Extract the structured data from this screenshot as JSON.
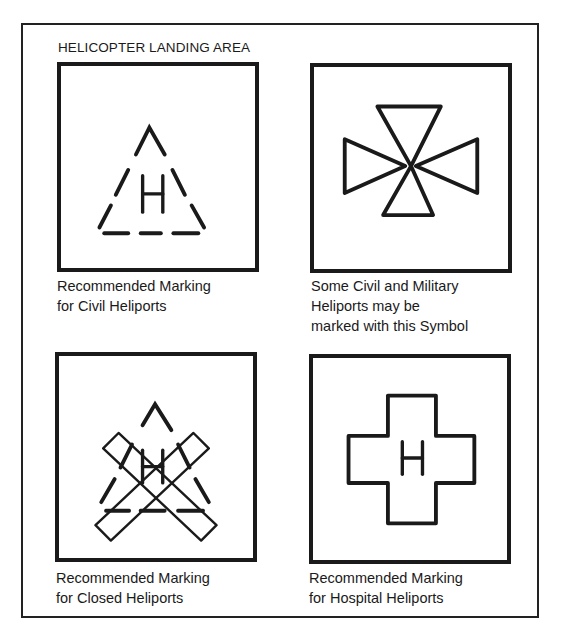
{
  "title": "HELICOPTER LANDING AREA",
  "panels": [
    {
      "symbol": "dashed-triangle-with-H",
      "caption_lines": [
        "Recommended Marking",
        "for Civil Heliports"
      ]
    },
    {
      "symbol": "maltese-cross",
      "caption_lines": [
        "Some Civil and Military",
        "Heliports may be",
        "marked with this Symbol"
      ]
    },
    {
      "symbol": "dashed-triangle-with-H-crossed-out",
      "caption_lines": [
        "Recommended Marking",
        "for Closed Heliports"
      ]
    },
    {
      "symbol": "cross-with-H",
      "caption_lines": [
        "Recommended Marking",
        "for Hospital Heliports"
      ]
    }
  ],
  "glyphs": {
    "h": "H"
  },
  "colors": {
    "ink": "#1a1a1a",
    "paper": "#ffffff"
  }
}
